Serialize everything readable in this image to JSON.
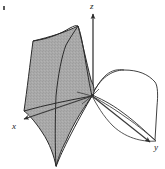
{
  "figure": {
    "type": "3d-surface-diagram",
    "caption": "",
    "axes": {
      "z": {
        "label": "z",
        "direction": "up"
      },
      "x": {
        "label": "x",
        "direction": "lower-left"
      },
      "y": {
        "label": "y",
        "direction": "lower-right"
      }
    },
    "surfaces": [
      {
        "name": "shaded-surface",
        "fill": "#a8a8a8",
        "stroke": "#2b2b2b",
        "description": "left cusp-folded sheet"
      },
      {
        "name": "white-surface",
        "fill": "#ffffff",
        "stroke": "#2b2b2b",
        "description": "right unshaded sheet"
      }
    ],
    "colors": {
      "shaded_fill": "#a8a8a8",
      "outline": "#2b2b2b",
      "axis": "#3a3a3a",
      "background": "#ffffff"
    },
    "origin_label": ""
  }
}
